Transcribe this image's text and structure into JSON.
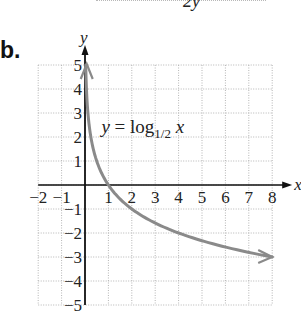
{
  "page": {
    "part_label": "b.",
    "top_fragment": "2y"
  },
  "chart_data": {
    "type": "line",
    "title": "",
    "function": "y = log_{1/2} x",
    "annotation": {
      "text_prefix": "y = log",
      "subscript": "1/2",
      "text_suffix": "x",
      "position": {
        "x": 1.0,
        "y": 2.5
      }
    },
    "xlabel": "x",
    "ylabel": "y",
    "xlim": [
      -2,
      8
    ],
    "ylim": [
      -5,
      5
    ],
    "grid": true,
    "grid_style": "dotted",
    "x_ticks": [
      -2,
      -1,
      1,
      2,
      3,
      4,
      5,
      6,
      7,
      8
    ],
    "x_tick_labels": [
      "−2",
      "−1",
      "1",
      "2",
      "3",
      "4",
      "5",
      "6",
      "7",
      "8"
    ],
    "y_ticks": [
      5,
      4,
      3,
      2,
      1,
      -1,
      -2,
      -3,
      -4,
      -5
    ],
    "y_tick_labels": [
      "5",
      "4",
      "3",
      "2",
      "1",
      "−1",
      "−2",
      "−3",
      "−4",
      "−5"
    ],
    "series": [
      {
        "name": "y = log_{1/2} x",
        "color": "#8a8a8a",
        "x": [
          0.03125,
          0.0625,
          0.125,
          0.25,
          0.5,
          1,
          2,
          3,
          4,
          5,
          6,
          7,
          8
        ],
        "y": [
          5,
          4,
          3,
          2,
          1,
          0,
          -1,
          -1.585,
          -2,
          -2.322,
          -2.585,
          -2.807,
          -3
        ],
        "arrow_ends": true
      }
    ],
    "colors": {
      "axis": "#111111",
      "grid": "#b5b5b5",
      "curve": "#8a8a8a",
      "text": "#222222"
    }
  }
}
